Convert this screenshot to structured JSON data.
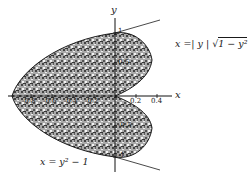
{
  "figure": {
    "type": "region-between-curves",
    "axes": {
      "x_label": "x",
      "y_label": "y",
      "x_ticks": [
        "-0.8",
        "-0.6",
        "-0.4",
        "-0.2",
        "0.2",
        "0.4"
      ],
      "y_ticks": [
        "1",
        "0.5",
        "-0.5",
        "-1"
      ]
    },
    "curves": [
      {
        "name": "parabola",
        "label": "x = y² − 1"
      },
      {
        "name": "right-curve",
        "label_prefix": "x =| y | ",
        "label_sqrt": "1 − y²"
      }
    ],
    "colors": {
      "ink": "#1a1a1a",
      "shading": "#555555",
      "background": "#ffffff"
    }
  }
}
